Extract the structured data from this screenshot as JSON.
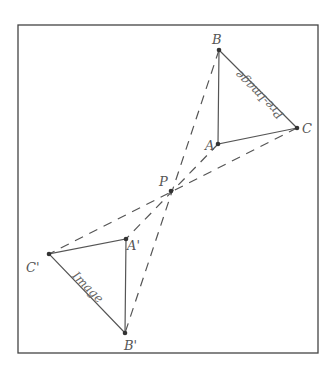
{
  "diagram": {
    "type": "point-reflection (half-turn about P)",
    "frame": {
      "x": 18,
      "y": 25,
      "w": 300,
      "h": 328
    },
    "center": {
      "label": "P",
      "x": 171,
      "y": 191
    },
    "preimage": {
      "caption": "Pre-Image",
      "vertices": [
        {
          "label": "A",
          "x": 218,
          "y": 144
        },
        {
          "label": "B",
          "x": 219,
          "y": 50
        },
        {
          "label": "C",
          "x": 297,
          "y": 128
        }
      ]
    },
    "image": {
      "caption": "Image",
      "vertices": [
        {
          "label": "A'",
          "x": 126,
          "y": 239
        },
        {
          "label": "B'",
          "x": 125,
          "y": 333
        },
        {
          "label": "C'",
          "x": 49,
          "y": 254
        }
      ]
    },
    "colors": {
      "line": "#555555",
      "frame": "#444444",
      "point": "#333333"
    }
  }
}
